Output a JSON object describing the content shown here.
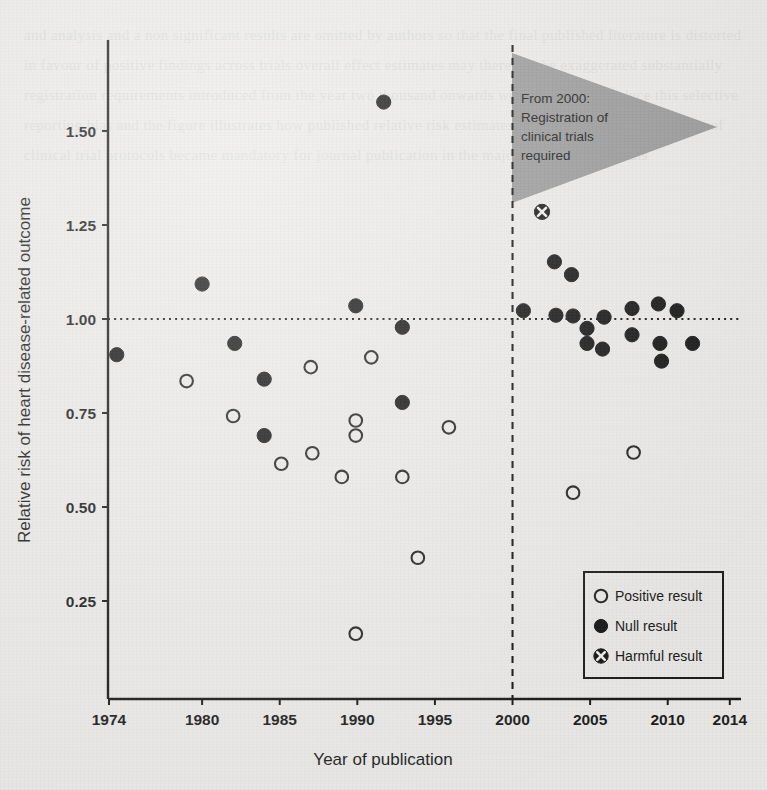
{
  "figure": {
    "kind": "scatter-plot",
    "y_axis_title": "Relative risk of heart disease-related outcome",
    "x_axis_title": "Year of publication"
  },
  "annotation": {
    "name": "registration-flag",
    "color": "#9a9a9a",
    "lines": [
      "From 2000:",
      "Registration of",
      "clinical trials",
      "required"
    ]
  },
  "legend": {
    "items": [
      {
        "marker": "open-circle",
        "label": "Positive result"
      },
      {
        "marker": "filled-circle",
        "label": "Null result"
      },
      {
        "marker": "circle-x",
        "label": "Harmful result"
      }
    ]
  },
  "chart_data": {
    "type": "scatter",
    "title": "",
    "xlabel": "Year of publication",
    "ylabel": "Relative risk of heart disease-related outcome",
    "xlim": [
      1974,
      2014
    ],
    "ylim": [
      0.1,
      1.62
    ],
    "xticks": [
      1974,
      1980,
      1985,
      1990,
      1995,
      2000,
      2005,
      2010,
      2014
    ],
    "xtick_labels": [
      "1974",
      "1980",
      "1985",
      "1990",
      "1995",
      "2000",
      "2005",
      "2010",
      "2014"
    ],
    "yticks": [
      0.25,
      0.5,
      0.75,
      1.0,
      1.25,
      1.5
    ],
    "ytick_labels": [
      "0.25",
      "0.50",
      "0.75",
      "1.00",
      "1.25",
      "1.50"
    ],
    "grid": false,
    "reference_lines": [
      {
        "name": "null-effect-line",
        "orientation": "horizontal",
        "value": 1.0,
        "style": "dotted"
      },
      {
        "name": "year-2000-line",
        "orientation": "vertical",
        "value": 2000,
        "style": "dashed"
      }
    ],
    "legend_position": "bottom-right",
    "series": [
      {
        "name": "Positive result",
        "marker": "open-circle",
        "color": "#ffffff",
        "edge_color": "#202020",
        "points": [
          [
            1979.0,
            0.835
          ],
          [
            1982.0,
            0.742
          ],
          [
            1985.1,
            0.615
          ],
          [
            1987.0,
            0.872
          ],
          [
            1987.1,
            0.643
          ],
          [
            1989.0,
            0.58
          ],
          [
            1989.9,
            0.73
          ],
          [
            1989.9,
            0.69
          ],
          [
            1989.9,
            0.163
          ],
          [
            1990.9,
            0.898
          ],
          [
            1992.9,
            0.58
          ],
          [
            1993.9,
            0.365
          ],
          [
            1995.9,
            0.712
          ],
          [
            2003.9,
            0.538
          ],
          [
            2007.8,
            0.645
          ]
        ]
      },
      {
        "name": "Null result",
        "marker": "filled-circle",
        "color": "#141414",
        "points": [
          [
            1974.5,
            0.905
          ],
          [
            1980.0,
            1.093
          ],
          [
            1982.1,
            0.935
          ],
          [
            1984.0,
            0.84
          ],
          [
            1984.0,
            0.69
          ],
          [
            1989.9,
            1.035
          ],
          [
            1991.7,
            1.577
          ],
          [
            1992.9,
            0.978
          ],
          [
            1992.9,
            0.778
          ],
          [
            2000.7,
            1.022
          ],
          [
            2002.7,
            1.152
          ],
          [
            2002.8,
            1.01
          ],
          [
            2003.8,
            1.118
          ],
          [
            2003.9,
            1.008
          ],
          [
            2004.8,
            0.975
          ],
          [
            2004.8,
            0.935
          ],
          [
            2005.8,
            0.92
          ],
          [
            2005.9,
            1.005
          ],
          [
            2007.7,
            1.028
          ],
          [
            2007.7,
            0.958
          ],
          [
            2009.4,
            1.04
          ],
          [
            2009.5,
            0.935
          ],
          [
            2009.6,
            0.888
          ],
          [
            2010.6,
            1.022
          ],
          [
            2011.6,
            0.935
          ]
        ]
      },
      {
        "name": "Harmful result",
        "marker": "circle-x",
        "color": "#141414",
        "points": [
          [
            2001.9,
            1.285
          ]
        ]
      }
    ]
  },
  "background_page_text": "and analysis and a non significant results are omitted by authors so that the final published literature is distorted in favour of positive findings across trials overall effect estimates may therefore be exaggerated substantially registration requirements introduced from the year two thousand onwards were intended to reduce this selective reporting bias and the figure illustrates how published relative risk estimates changed once pre registration of clinical trial protocols became mandatory for journal publication in the major medical periodicals"
}
